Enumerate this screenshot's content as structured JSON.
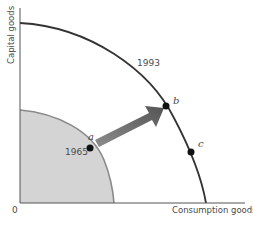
{
  "figure": {
    "y_axis_label": "Capital goods",
    "x_axis_label": "Consumption goods",
    "origin_label": "0",
    "curves": [
      {
        "name": "ppf-1965",
        "label": "1965",
        "fill": "#d4d4d4",
        "stroke": "#8a8a8a"
      },
      {
        "name": "ppf-1993",
        "label": "1993",
        "stroke": "#333333"
      }
    ],
    "points": [
      {
        "id": "a",
        "label": "a",
        "on_curve": "1965"
      },
      {
        "id": "b",
        "label": "b",
        "on_curve": "1993"
      },
      {
        "id": "c",
        "label": "c",
        "on_curve": "1993"
      }
    ],
    "arrow": {
      "from": "a",
      "to": "b",
      "color": "#666666"
    },
    "colors": {
      "axis": "#555555",
      "background": "#ffffff"
    }
  }
}
